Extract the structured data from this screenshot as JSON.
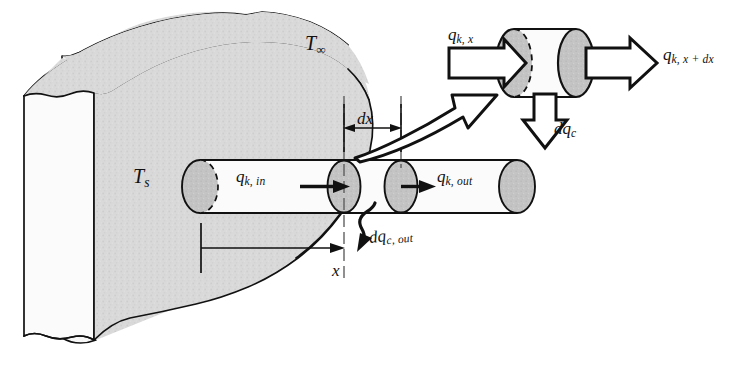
{
  "figure": {
    "domain": "diagram",
    "width": 741,
    "height": 367,
    "background_color": "#ffffff",
    "line_color": "#111111",
    "wall_fill_color": "#d9d9d9",
    "rod_fill_color": "#fafafa",
    "section_fill_color": "#bdbdbd",
    "endcap_fill_color": "#c8c8c8"
  },
  "labels": {
    "t_infinity": {
      "symbol": "T",
      "subscript": "∞",
      "text": "T∞"
    },
    "t_surface": {
      "symbol": "T",
      "subscript": "s",
      "text": "Ts"
    },
    "qk_in": {
      "symbol": "q",
      "subscript": "k, in",
      "text": "qk, in"
    },
    "qk_out": {
      "symbol": "q",
      "subscript": "k, out",
      "text": "qk, out"
    },
    "dx": {
      "text": "dx"
    },
    "x": {
      "text": "x"
    },
    "dqc_out": {
      "symbol": "dq",
      "subscript": "c, out",
      "text": "dqc, out"
    },
    "qk_x": {
      "symbol": "q",
      "subscript": "k, x",
      "text": "qk, x"
    },
    "qk_x_plus_dx": {
      "symbol": "q",
      "subscript": "k, x + dx",
      "text": "qk, x + dx"
    },
    "dqc": {
      "symbol": "dq",
      "subscript": "c",
      "text": "dqc"
    }
  },
  "elements": {
    "wall": "broken-away solid wall block at left, shaded gray, with jagged torn top and bottom edges",
    "rod": "horizontal cylindrical fin extending right from the wall",
    "rod_left_cap": "half-dashed hidden ellipse where rod enters the wall",
    "rod_right_cap": "gray filled ellipse at free end of rod",
    "section_x": "gray cross-section ellipse at station x",
    "section_x_dx": "gray cross-section ellipse at station x + dx",
    "dimension_dx": "double headed dimension arrow spanning dx between the two station centerlines",
    "dimension_x": "dimension arrow from wall face to station x",
    "callout_arrow": "large hollow curved magnification arrow from rod element to inset control volume",
    "inset_cv": "magnified differential control volume cylinder at top right",
    "inset_in_arrow": "hollow block arrow entering the control volume from the left",
    "inset_out_arrow": "hollow block arrow leaving the control volume to the right",
    "inset_down_arrow": "hollow block arrow leaving the control volume downward (convection)"
  }
}
